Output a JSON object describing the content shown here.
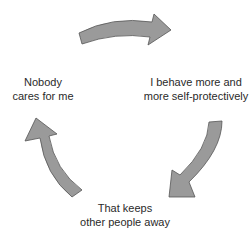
{
  "diagram": {
    "type": "cycle",
    "arrow_fill": "#9a9a9a",
    "arrow_stroke": "#555555",
    "nodes": [
      {
        "id": "left",
        "lines": [
          "Nobody",
          "cares for me"
        ]
      },
      {
        "id": "right",
        "lines": [
          "I behave more and",
          "more self-protectively"
        ]
      },
      {
        "id": "bottom",
        "lines": [
          "That keeps",
          "other people away"
        ]
      }
    ],
    "arrows": [
      {
        "from": "left",
        "to": "right",
        "position": "top"
      },
      {
        "from": "right",
        "to": "bottom",
        "position": "right"
      },
      {
        "from": "bottom",
        "to": "left",
        "position": "left"
      }
    ]
  }
}
